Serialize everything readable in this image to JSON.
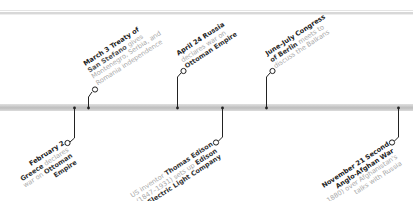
{
  "timeline": {
    "colors": {
      "bar": "#c4c4c4",
      "connector": "#222222",
      "title_text": "#222222",
      "body_text": "#a8a8a8"
    },
    "events": [
      {
        "id": "feb-2",
        "position": "below",
        "date": "February 2",
        "lines": [
          "Greece declares",
          "war on Ottoman",
          "Empire"
        ],
        "bold_terms": [
          "Greece",
          "Ottoman",
          "Empire"
        ]
      },
      {
        "id": "mar-3",
        "position": "above",
        "date": "March 3",
        "title_rest": "Treaty of",
        "lines": [
          "San Stefano gives",
          "Montenegro, Serbia, and",
          "Romania independence"
        ]
      },
      {
        "id": "apr-24",
        "position": "above",
        "date": "April 24",
        "title_rest": "Russia",
        "lines": [
          "declares war on",
          "Ottoman Empire"
        ]
      },
      {
        "id": "edison",
        "position": "below",
        "lines": [
          "US inventor Thomas Edison",
          "(1847–1931) sets up Edison",
          "Electric Light Company"
        ]
      },
      {
        "id": "june-july",
        "position": "above",
        "date": "June–July",
        "title_rest": "Congress",
        "lines": [
          "of Berlin meets to",
          "discuss the Balkans"
        ]
      },
      {
        "id": "nov-21",
        "position": "below",
        "date": "November 21",
        "title_rest": "Second",
        "lines": [
          "Anglo-Afghan War",
          "(to 1880) over Afghanistan's",
          "talks with Russia"
        ]
      }
    ]
  }
}
